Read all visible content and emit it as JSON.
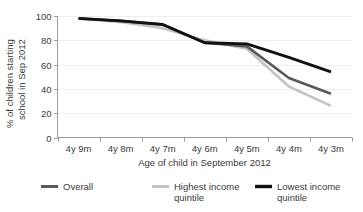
{
  "chart_data": {
    "type": "line",
    "title": "",
    "xlabel": "Age of child in September 2012",
    "ylabel": "% of children starting school in Sep 2012",
    "categories": [
      "4y 9m",
      "4y 8m",
      "4y 7m",
      "4y 6m",
      "4y 5m",
      "4y 4m",
      "4y 3m"
    ],
    "ylim": [
      0,
      100
    ],
    "yticks": [
      0,
      20,
      40,
      60,
      80,
      100
    ],
    "ytick_labels": [
      "0",
      "20",
      "40",
      "60",
      "80",
      "100"
    ],
    "grid": true,
    "legend_position": "bottom",
    "series": [
      {
        "name": "Overall",
        "color": "#595959",
        "width": 2.6,
        "values": [
          98,
          96,
          93,
          78,
          75,
          49,
          36
        ]
      },
      {
        "name": "Highest income quintile",
        "color": "#c4c4c4",
        "width": 2.6,
        "values": [
          98,
          95,
          90,
          80,
          73,
          42,
          26
        ]
      },
      {
        "name": "Lowest income quintile",
        "color": "#111111",
        "width": 2.8,
        "values": [
          98,
          96,
          93,
          78,
          77,
          66,
          54
        ]
      }
    ]
  },
  "axis": {
    "y_title": "% of children starting school in Sep 2012",
    "y_title_line1": "% of children starting",
    "y_title_line2": "school in Sep 2012",
    "x_title": "Age of child in September 2012"
  },
  "legend": {
    "items": [
      {
        "label": "Overall",
        "label_line1": "Overall",
        "label_line2": "",
        "color": "#595959"
      },
      {
        "label": "Highest income quintile",
        "label_line1": "Highest income",
        "label_line2": "quintile",
        "color": "#c4c4c4"
      },
      {
        "label": "Lowest income quintile",
        "label_line1": "Lowest income",
        "label_line2": "quintile",
        "color": "#111111"
      }
    ]
  }
}
